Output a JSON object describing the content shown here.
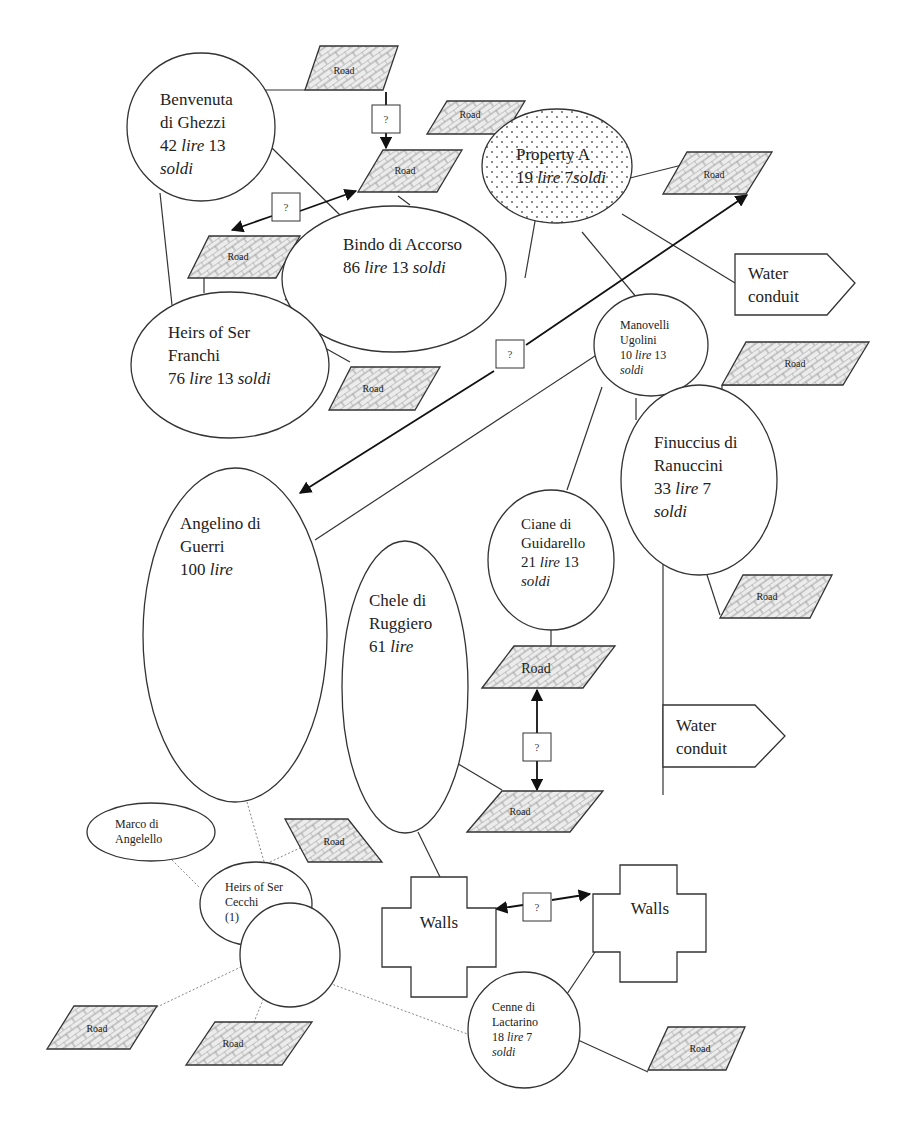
{
  "diagram": {
    "properties": {
      "benvenuta": {
        "lines": [
          "Benvenuta",
          "di Ghezzi"
        ],
        "value_num": "42",
        "value_unit1": "lire",
        "value_num2": "13",
        "value_unit2": "soldi"
      },
      "bindo": {
        "name": "Bindo di Accorso",
        "value_num": "86",
        "value_unit1": "lire",
        "value_num2": "13",
        "value_unit2": "soldi"
      },
      "property_a": {
        "name": "Property A",
        "value_num": "19",
        "value_unit1": "lire",
        "value_num2": "7",
        "value_unit2": "soldi"
      },
      "franchi": {
        "lines": [
          "Heirs of Ser",
          "Franchi"
        ],
        "value_num": "76",
        "value_unit1": "lire",
        "value_num2": "13",
        "value_unit2": "soldi"
      },
      "manovelli": {
        "lines": [
          "Manovelli",
          "Ugolini"
        ],
        "value_num": "10",
        "value_unit1": "lire",
        "value_num2": "13",
        "value_unit2": "soldi"
      },
      "finuccius": {
        "lines": [
          "Finuccius di",
          "Ranuccini"
        ],
        "value_num": "33",
        "value_unit1": "lire",
        "value_num2": "7",
        "value_unit2": "soldi"
      },
      "angelino": {
        "lines": [
          "Angelino di",
          "Guerri"
        ],
        "value_num": "100",
        "value_unit1": "lire"
      },
      "chele": {
        "lines": [
          "Chele di",
          "Ruggiero"
        ],
        "value_num": "61",
        "value_unit1": "lire"
      },
      "ciane": {
        "lines": [
          "Ciane di",
          "Guidarello"
        ],
        "value_num": "21",
        "value_unit1": "lire",
        "value_num2": "13",
        "value_unit2": "soldi"
      },
      "marco": {
        "lines": [
          "Marco di",
          "Angelello"
        ]
      },
      "cecchi": {
        "lines": [
          "Heirs of Ser",
          "Cecchi",
          "(1)"
        ]
      },
      "cenne": {
        "lines": [
          "Cenne di",
          "Lactarino"
        ],
        "value_num": "18",
        "value_unit1": "lire",
        "value_num2": "7",
        "value_unit2": "soldi"
      }
    },
    "road_label": "Road",
    "walls_label": "Walls",
    "conduit": {
      "line1": "Water",
      "line2": "conduit"
    },
    "unknown_label": "?"
  }
}
